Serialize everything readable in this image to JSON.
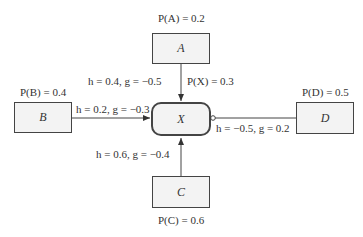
{
  "diagram": {
    "nodes": [
      {
        "id": "A",
        "label": "A",
        "prob": "P(A) = 0.2"
      },
      {
        "id": "B",
        "label": "B",
        "prob": "P(B) = 0.4"
      },
      {
        "id": "C",
        "label": "C",
        "prob": "P(C) = 0.6"
      },
      {
        "id": "D",
        "label": "D",
        "prob": "P(D) = 0.5"
      },
      {
        "id": "X",
        "label": "X",
        "prob": "P(X) = 0.3"
      }
    ],
    "edges": [
      {
        "from": "A",
        "to": "X",
        "label": "h = 0.4,  g = −0.5",
        "type": "arrow"
      },
      {
        "from": "B",
        "to": "X",
        "label": "h = 0.2,  g = −0.3",
        "type": "arrow"
      },
      {
        "from": "C",
        "to": "X",
        "label": "h = 0.6,  g = −0.4",
        "type": "arrow"
      },
      {
        "from": "D",
        "to": "X",
        "label": "h = −0.5,  g = 0.2",
        "type": "inhibitor-circle"
      }
    ]
  }
}
